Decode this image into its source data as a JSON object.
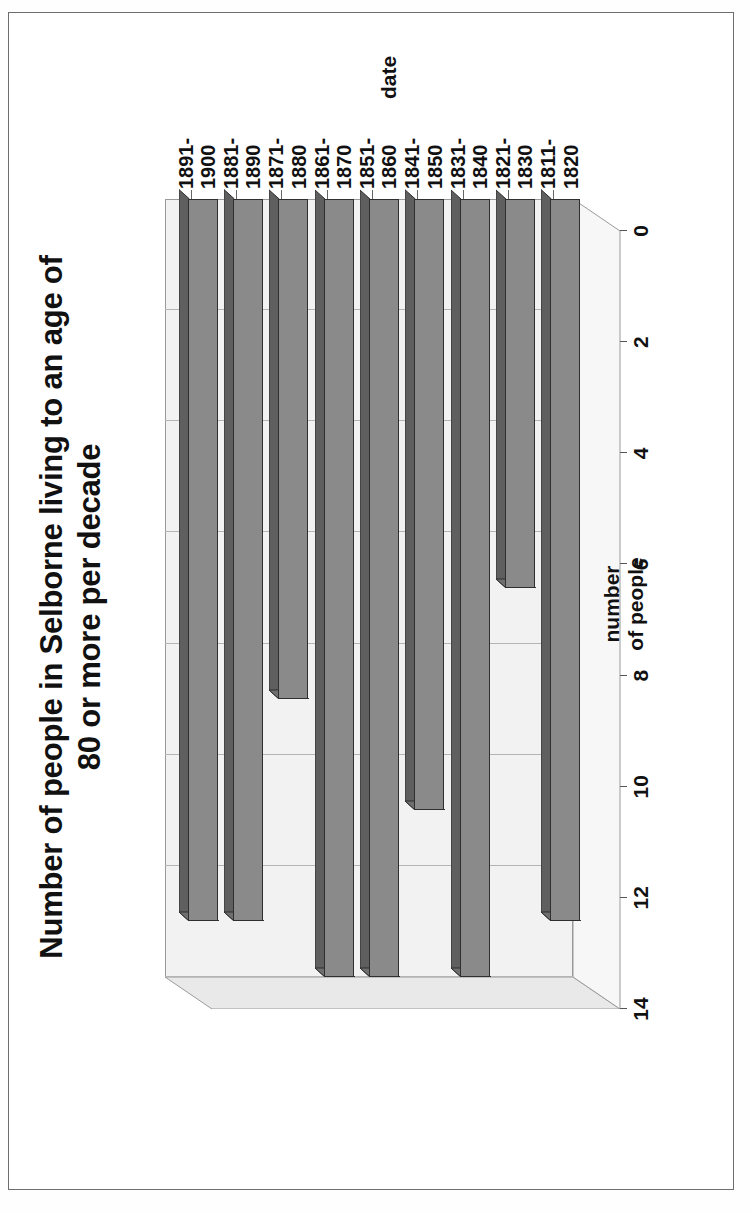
{
  "chart_data": {
    "type": "bar",
    "orientation": "vertical-3d",
    "title": "Number of people in Selborne living to an age of 80 or more per decade",
    "title_line1": "Number of people in Selborne living to an age of",
    "title_line2": "80 or more per decade",
    "xlabel": "date",
    "ylabel": "number of people",
    "ylabel_line1": "number",
    "ylabel_line2": "of people",
    "categories": [
      "1811-1820",
      "1821-1830",
      "1831-1840",
      "1841-1850",
      "1851-1860",
      "1861-1870",
      "1871-1880",
      "1881-1890",
      "1891-1900"
    ],
    "category_labels": [
      {
        "l1": "1811-",
        "l2": "1820"
      },
      {
        "l1": "1821-",
        "l2": "1830"
      },
      {
        "l1": "1831-",
        "l2": "1840"
      },
      {
        "l1": "1841-",
        "l2": "1850"
      },
      {
        "l1": "1851-",
        "l2": "1860"
      },
      {
        "l1": "1861-",
        "l2": "1870"
      },
      {
        "l1": "1871-",
        "l2": "1880"
      },
      {
        "l1": "1881-",
        "l2": "1890"
      },
      {
        "l1": "1891-",
        "l2": "1900"
      }
    ],
    "values": [
      13,
      7,
      14,
      11,
      14,
      14,
      9,
      13,
      13
    ],
    "ylim": [
      0,
      14
    ],
    "yticks": [
      0,
      2,
      4,
      6,
      8,
      10,
      12,
      14
    ],
    "ytick_labels": [
      "0",
      "2",
      "4",
      "6",
      "8",
      "10",
      "12",
      "14"
    ],
    "grid": true,
    "legend": false,
    "bar_color": "#8a8a8a",
    "bar_top_color": "#5f5f5f",
    "bar_edge_color": "#2f2f2f",
    "plot_background": "#f2f2f2",
    "page_background": "#ffffff"
  },
  "rotation": "The chart is printed rotated 90 degrees counter-clockwise on the page."
}
